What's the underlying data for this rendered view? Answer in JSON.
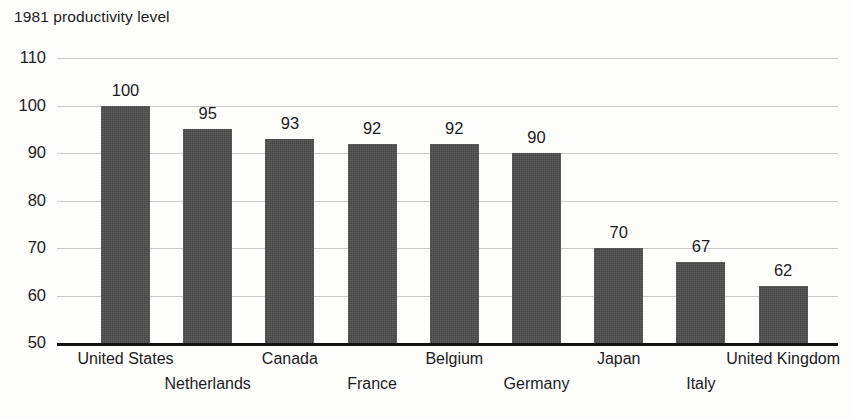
{
  "chart_data": {
    "type": "bar",
    "title": "1981 productivity level",
    "xlabel": "",
    "ylabel": "",
    "ylim": [
      50,
      110
    ],
    "yticks": [
      110,
      100,
      90,
      80,
      70,
      60,
      50
    ],
    "grid": true,
    "legend": null,
    "bar_color": "#4c4c4c",
    "categories": [
      "United States",
      "Netherlands",
      "Canada",
      "France",
      "Belgium",
      "Germany",
      "Japan",
      "Italy",
      "United Kingdom"
    ],
    "values": [
      100,
      95,
      93,
      92,
      92,
      90,
      70,
      67,
      62
    ],
    "value_labels": [
      "100",
      "95",
      "93",
      "92",
      "92",
      "90",
      "70",
      "67",
      "62"
    ],
    "label_rows": [
      0,
      1,
      0,
      1,
      0,
      1,
      0,
      1,
      0
    ]
  }
}
